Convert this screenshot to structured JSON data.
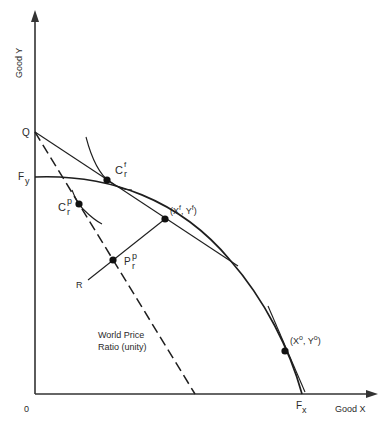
{
  "diagram": {
    "axes": {
      "y_label": "Good Y",
      "x_label": "Good X",
      "origin_label": "0"
    },
    "labels": {
      "Q": "Q",
      "Fy_main": "F",
      "Fy_sub": "y",
      "Fx_main": "F",
      "Fx_sub": "x",
      "Cf_main": "C",
      "Cf_sup": "f",
      "Cf_sub": "r",
      "Cp_main": "C",
      "Cp_sup": "p",
      "Cp_sub": "r",
      "Pp_main": "P",
      "Pp_sup": "p",
      "Pp_sub": "r",
      "R": "R",
      "xf_point": "(X",
      "xf_sup": "f",
      "yf_mid": ", Y",
      "yf_sup": "f",
      "xf_close": ")",
      "xo_point": "(X",
      "xo_sup": "o",
      "yo_mid": ", Y",
      "yo_sup": "o",
      "xo_close": ")",
      "world_price_line1": "World Price",
      "world_price_line2": "Ratio (unity)"
    },
    "curves": [
      {
        "name": "production-possibility-frontier",
        "from": "Fy",
        "to": "Fx",
        "shape": "concave"
      },
      {
        "name": "free-trade-price-line",
        "from": "Q",
        "tangent_at": "(Xf, Yf)"
      },
      {
        "name": "world-price-line",
        "from": "Q",
        "style": "dashed",
        "slope": "unity"
      },
      {
        "name": "indifference-curve-free-trade",
        "tangent_at": "Cf"
      },
      {
        "name": "indifference-curve-protection",
        "tangent_at": "Cp"
      },
      {
        "name": "line-R-to-Xf",
        "through": "Pp"
      },
      {
        "name": "tangent-at-Xo"
      }
    ],
    "points": [
      "Cf",
      "Cp",
      "Pp",
      "(Xf, Yf)",
      "(Xo, Yo)"
    ]
  }
}
